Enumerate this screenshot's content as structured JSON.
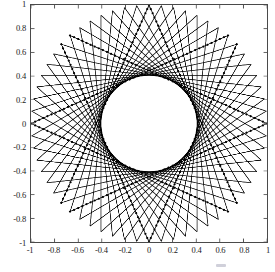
{
  "figure": {
    "background_color": "#ffffff",
    "axes_color": "#4a4a4a",
    "line_color": "#000000",
    "marker_color": "#000000"
  },
  "axes": {
    "box": {
      "left": 30,
      "top": 4,
      "width": 238,
      "height": 239
    },
    "xticks": [
      "-1",
      "-0.8",
      "-0.6",
      "-0.4",
      "-0.2",
      "0",
      "0.2",
      "0.4",
      "0.6",
      "0.8",
      "1"
    ],
    "yticks": [
      "1",
      "0.8",
      "0.6",
      "0.4",
      "0.2",
      "0",
      "-0.2",
      "-0.4",
      "-0.6",
      "-0.8",
      "-1"
    ],
    "xlabel": "",
    "ylabel": "",
    "title": ""
  },
  "chart_data": {
    "type": "line",
    "title": "",
    "xlabel": "",
    "ylabel": "",
    "xlim": [
      -1,
      1
    ],
    "ylim": [
      -1,
      1
    ],
    "xticks": [
      -1,
      -0.8,
      -0.6,
      -0.4,
      -0.2,
      0,
      0.2,
      0.4,
      0.6,
      0.8,
      1
    ],
    "yticks": [
      -1,
      -0.8,
      -0.6,
      -0.4,
      -0.2,
      0,
      0.2,
      0.4,
      0.6,
      0.8,
      1
    ],
    "grid": false,
    "legend": null,
    "geometry": {
      "outer_radius": 1.0,
      "inner_hole_radius": 0.3,
      "center": [
        0,
        0
      ],
      "arc_family_count": 2,
      "arcs_per_family": 60,
      "arc_chord_step_family_a": 22,
      "arc_chord_step_family_b": -22,
      "marker_arc_indices": [
        0,
        15,
        30,
        45
      ],
      "marker_points_per_arc": 48
    },
    "series": [
      {
        "name": "arc-family-clockwise",
        "style": "solid",
        "color": "#000000",
        "linewidth": 0.8,
        "count": 60
      },
      {
        "name": "arc-family-counterclockwise",
        "style": "solid",
        "color": "#000000",
        "linewidth": 0.8,
        "count": 60
      },
      {
        "name": "marker-spiral-trails",
        "style": "dotted-markers",
        "color": "#000000",
        "marker": "point",
        "markersize": 2.2,
        "count": 4
      }
    ]
  },
  "artifact": {
    "name": "faint-watermark-mark",
    "visible": true
  }
}
